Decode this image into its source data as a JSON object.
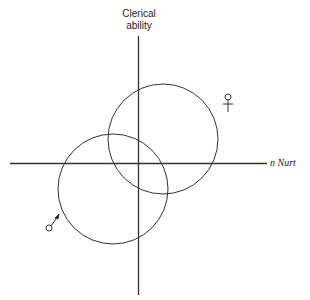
{
  "diagram": {
    "y_axis_label_line1": "Clerical",
    "y_axis_label_line2": "ability",
    "x_axis_label": "n Nurt",
    "groups": [
      {
        "name": "female",
        "symbol": "♀",
        "circle": {
          "cx": 163,
          "cy": 139,
          "r": 55
        }
      },
      {
        "name": "male",
        "symbol": "♂",
        "circle": {
          "cx": 113,
          "cy": 189,
          "r": 55
        }
      }
    ],
    "colors": {
      "line": "#333333",
      "background": "#ffffff"
    }
  }
}
